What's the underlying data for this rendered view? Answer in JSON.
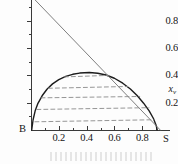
{
  "figure": {
    "background_color": "#fdfdfd",
    "axis_color": "#3a3a3a"
  },
  "chart_data": {
    "type": "line",
    "title": "",
    "subtitle": "",
    "xlabel": "",
    "ylabel": "x",
    "ylabel_subscript": "v",
    "xlim": [
      0,
      1.0
    ],
    "ylim": [
      0,
      0.95
    ],
    "grid": false,
    "legend": null,
    "x_ticks": [
      0.2,
      0.4,
      0.6,
      0.8
    ],
    "x_tick_labels": [
      "0.2",
      "0.4",
      "0.6",
      "0.8"
    ],
    "x_minor_ticks": [
      0.1,
      0.3,
      0.5,
      0.7,
      0.9
    ],
    "y_ticks": [
      0.2,
      0.4,
      0.6,
      0.8
    ],
    "y_tick_labels": [
      "0.2",
      "0.4",
      "0.6",
      "0.8"
    ],
    "y_minor_ticks": [
      0.1,
      0.3,
      0.5,
      0.7,
      0.9
    ],
    "endpoint_labels": {
      "left": "B",
      "right": "S"
    },
    "series": [
      {
        "name": "binodal-dome",
        "style": "solid",
        "color": "#1c1c1c",
        "width": 1.4,
        "points": [
          [
            0.005,
            0.0
          ],
          [
            0.015,
            0.075
          ],
          [
            0.03,
            0.14
          ],
          [
            0.05,
            0.195
          ],
          [
            0.08,
            0.25
          ],
          [
            0.115,
            0.298
          ],
          [
            0.155,
            0.337
          ],
          [
            0.2,
            0.368
          ],
          [
            0.25,
            0.392
          ],
          [
            0.3,
            0.407
          ],
          [
            0.35,
            0.416
          ],
          [
            0.42,
            0.42
          ],
          [
            0.48,
            0.415
          ],
          [
            0.54,
            0.402
          ],
          [
            0.6,
            0.378
          ],
          [
            0.66,
            0.342
          ],
          [
            0.715,
            0.3
          ],
          [
            0.765,
            0.25
          ],
          [
            0.81,
            0.196
          ],
          [
            0.85,
            0.14
          ],
          [
            0.88,
            0.086
          ],
          [
            0.9,
            0.035
          ],
          [
            0.908,
            0.0
          ]
        ]
      },
      {
        "name": "tangent-line",
        "style": "solid",
        "color": "#7e7e7e",
        "width": 1.0,
        "points": [
          [
            0.03,
            0.95
          ],
          [
            0.93,
            0.0
          ]
        ]
      },
      {
        "name": "tie-line-1",
        "style": "dashed",
        "color": "#8a8a8a",
        "width": 0.9,
        "points": [
          [
            0.028,
            0.06
          ],
          [
            0.885,
            0.075
          ]
        ]
      },
      {
        "name": "tie-line-2",
        "style": "dashed",
        "color": "#8a8a8a",
        "width": 0.9,
        "points": [
          [
            0.042,
            0.15
          ],
          [
            0.848,
            0.163
          ]
        ]
      },
      {
        "name": "tie-line-3",
        "style": "dashed",
        "color": "#8a8a8a",
        "width": 0.9,
        "points": [
          [
            0.072,
            0.235
          ],
          [
            0.782,
            0.245
          ]
        ]
      },
      {
        "name": "tie-line-4",
        "style": "dashed",
        "color": "#8a8a8a",
        "width": 0.9,
        "points": [
          [
            0.125,
            0.305
          ],
          [
            0.695,
            0.318
          ]
        ]
      },
      {
        "name": "tie-line-5",
        "style": "dashed",
        "color": "#8a8a8a",
        "width": 0.9,
        "points": [
          [
            0.24,
            0.388
          ],
          [
            0.555,
            0.399
          ]
        ]
      }
    ],
    "annotations": [
      {
        "name": "point-B",
        "text": "B",
        "x": 0.0,
        "y": 0.0
      },
      {
        "name": "point-S",
        "text": "S",
        "x": 0.93,
        "y": 0.0
      }
    ]
  }
}
